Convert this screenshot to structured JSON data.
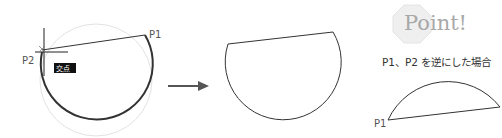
{
  "step1": {
    "p1_label": "P1",
    "p2_label": "P2",
    "snap_tooltip": "交点"
  },
  "step2": {
    "arrow": "right-arrow"
  },
  "point_box": {
    "title": "Point!",
    "note": "P1、P2 を逆にした場合",
    "p1_label": "P1"
  },
  "colors": {
    "stroke": "#333333",
    "faint_circle": "#dddddd",
    "tooltip_bg": "#111111",
    "arrow": "#555555",
    "badge_bg": "#ececec"
  }
}
